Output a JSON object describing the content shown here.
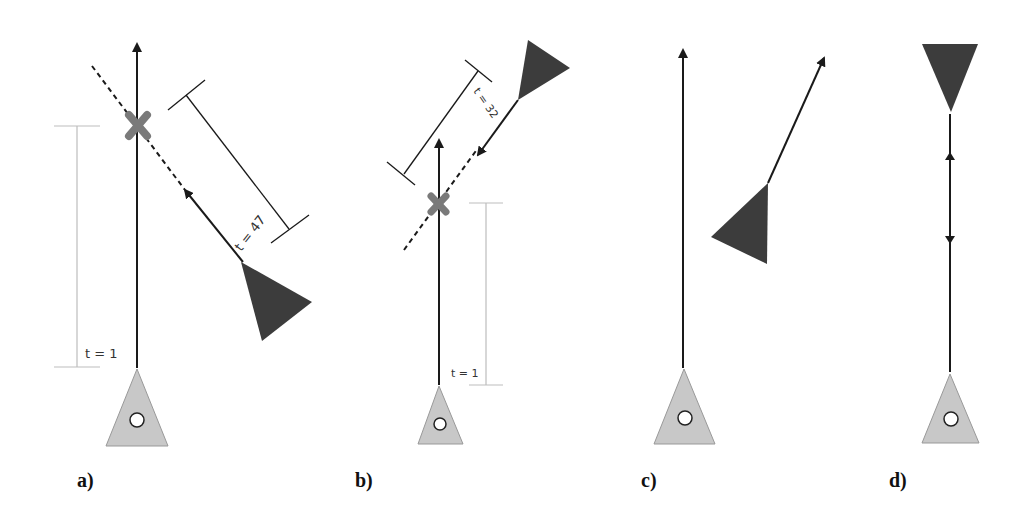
{
  "figure": {
    "panels": [
      {
        "id": "a",
        "label": "a)",
        "own_time_label": "t = 1",
        "other_time_label": "t = 47",
        "collision_marker": true
      },
      {
        "id": "b",
        "label": "b)",
        "own_time_label": "t = 1",
        "other_time_label": "t = 32",
        "collision_marker": true
      },
      {
        "id": "c",
        "label": "c)",
        "collision_marker": false
      },
      {
        "id": "d",
        "label": "d)",
        "collision_marker": false
      }
    ],
    "colors": {
      "own_agent_fill": "#c8c8c8",
      "other_agent_fill": "#3c3c3c",
      "collision_marker": "#7a7a7a",
      "line": "#1a1a1a",
      "guide": "#bdbdbd"
    }
  }
}
